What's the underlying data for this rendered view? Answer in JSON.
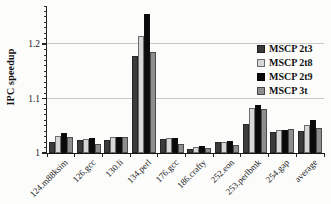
{
  "chart_data": {
    "type": "bar",
    "title": "",
    "xlabel": "",
    "ylabel": "IPC speedup",
    "ylim": [
      1.0,
      1.27
    ],
    "yticks": [
      1.0,
      1.1,
      1.2
    ],
    "ytick_labels": [
      "1",
      "1.1",
      "1.2"
    ],
    "y_minor_tick_step": 0.01,
    "grid_values": [
      1.1,
      1.2
    ],
    "grid": "horizontal-major",
    "legend_position": "upper-right-inside",
    "categories": [
      "124.m88ksim",
      "126.gcc",
      "130.li",
      "134.perl",
      "176.gcc",
      "186.crafty",
      "252.eon",
      "253.perlbmk",
      "254.gap",
      "average"
    ],
    "series": [
      {
        "name": "MSCP 2t3",
        "color": "#3b3b3b",
        "values": [
          1.021,
          1.023,
          1.023,
          1.178,
          1.025,
          1.007,
          1.02,
          1.054,
          1.038,
          1.041
        ]
      },
      {
        "name": "MSCP 2t8",
        "color": "#d7d7d7",
        "values": [
          1.031,
          1.026,
          1.029,
          1.215,
          1.027,
          1.011,
          1.021,
          1.082,
          1.043,
          1.051
        ]
      },
      {
        "name": "MSCP 2t9",
        "color": "#0a0a0a",
        "values": [
          1.037,
          1.027,
          1.03,
          1.255,
          1.028,
          1.013,
          1.022,
          1.088,
          1.042,
          1.06
        ]
      },
      {
        "name": "MSCP 3t",
        "color": "#8e8e8e",
        "values": [
          1.03,
          1.017,
          1.029,
          1.185,
          1.017,
          1.01,
          1.015,
          1.08,
          1.044,
          1.046
        ]
      }
    ],
    "colors": {
      "axis": "#222222",
      "gridline": "#c9c9c9",
      "text": "#1a1a1a",
      "background": "#fcfcfb"
    }
  }
}
